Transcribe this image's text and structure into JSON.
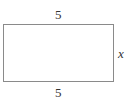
{
  "diagram": {
    "shape": "rectangle",
    "labels": {
      "top": "5",
      "bottom": "5",
      "right": "x"
    }
  }
}
